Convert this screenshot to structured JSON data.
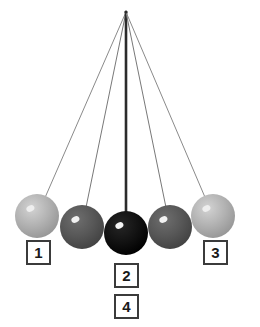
{
  "figure": {
    "type": "pendulum-cradle-diagram",
    "background_color": "#ffffff",
    "width": 260,
    "height": 327
  },
  "pivot": {
    "x": 126,
    "y": 12
  },
  "strings": {
    "thin_color": "#8a8a8a",
    "thin_width": 1,
    "center_color": "#2b2b2b",
    "center_width": 2.6
  },
  "balls": [
    {
      "name": "ball-left-outer",
      "cx": 37,
      "cy": 216,
      "r": 22,
      "fill": "#b2b2b2",
      "fill_edge": "#9a9a9a",
      "highlight": "#eeeeee",
      "string_color": "#8a8a8a"
    },
    {
      "name": "ball-left-inner",
      "cx": 82,
      "cy": 227,
      "r": 22,
      "fill": "#575757",
      "fill_edge": "#454545",
      "highlight": "#f2f2f2",
      "string_color": "#787878"
    },
    {
      "name": "ball-center",
      "cx": 126,
      "cy": 233,
      "r": 22,
      "fill": "#121212",
      "fill_edge": "#000000",
      "highlight": "#f5f5f5",
      "string_color": "#2b2b2b"
    },
    {
      "name": "ball-right-inner",
      "cx": 170,
      "cy": 227,
      "r": 22,
      "fill": "#575757",
      "fill_edge": "#454545",
      "highlight": "#f2f2f2",
      "string_color": "#787878"
    },
    {
      "name": "ball-right-outer",
      "cx": 213,
      "cy": 216,
      "r": 22,
      "fill": "#b2b2b2",
      "fill_edge": "#9a9a9a",
      "highlight": "#eeeeee",
      "string_color": "#8a8a8a"
    }
  ],
  "labels": [
    {
      "id": "1",
      "text": "1",
      "left": 26,
      "top": 240
    },
    {
      "id": "3",
      "text": "3",
      "left": 203,
      "top": 240
    },
    {
      "id": "2",
      "text": "2",
      "left": 114,
      "top": 263
    },
    {
      "id": "4",
      "text": "4",
      "left": 114,
      "top": 294
    }
  ]
}
